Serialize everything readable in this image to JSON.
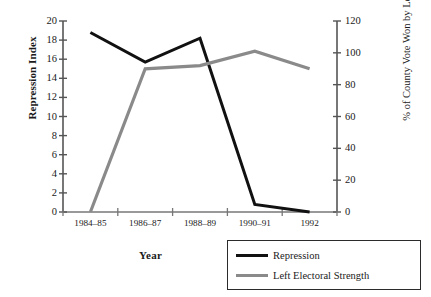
{
  "chart_data": {
    "type": "line",
    "title": "",
    "xlabel": "Year",
    "ylabel": "Repression Index",
    "y2label": "% of County Vote Won by Left",
    "categories": [
      "1984–85",
      "1986–87",
      "1988–89",
      "1990–91",
      "1992"
    ],
    "ylim": [
      0,
      20
    ],
    "yticks": [
      0,
      2,
      4,
      6,
      8,
      10,
      12,
      14,
      16,
      18,
      20
    ],
    "y2lim": [
      0,
      120
    ],
    "y2ticks": [
      0,
      20,
      40,
      60,
      80,
      100,
      120
    ],
    "grid": false,
    "legend_position": "bottom-right",
    "series": [
      {
        "name": "Repression",
        "axis": "left",
        "color": "#111111",
        "values": [
          18.8,
          15.7,
          18.2,
          0.8,
          0.0
        ]
      },
      {
        "name": "Left Electoral Strength",
        "axis": "right",
        "color": "#8a8a8a",
        "values": [
          0,
          90,
          92,
          101,
          90
        ]
      }
    ]
  },
  "legend": {
    "items": [
      {
        "label": "Repression",
        "swatch": "thick-black-line"
      },
      {
        "label": "Left Electoral Strength",
        "swatch": "thick-gray-line"
      }
    ]
  }
}
